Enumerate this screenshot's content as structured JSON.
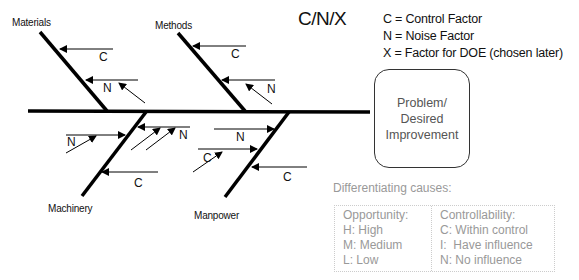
{
  "title": "C/N/X",
  "legend": {
    "items": [
      "C = Control Factor",
      "N = Noise Factor",
      "X = Factor for DOE (chosen later)"
    ]
  },
  "problem": {
    "line1": "Problem/",
    "line2": "Desired",
    "line3": "Improvement"
  },
  "categories": {
    "materials": "Materials",
    "methods": "Methods",
    "machinery": "Machinery",
    "manpower": "Manpower"
  },
  "cause_markers": {
    "materials_c": "C",
    "materials_n": "N",
    "methods_c": "C",
    "methods_n": "N",
    "machinery_n_left": "N",
    "machinery_n_right": "N",
    "machinery_c": "C",
    "manpower_n": "N",
    "manpower_c_left": "C",
    "manpower_c_right": "C"
  },
  "differentiating": {
    "title": "Differentiating causes:",
    "opportunity": {
      "header": "Opportunity:",
      "items": [
        "H: High",
        "M: Medium",
        "L: Low"
      ]
    },
    "controllability": {
      "header": "Controllability:",
      "items": [
        "C: Within control",
        "I:  Have influence",
        "N: No influence"
      ]
    }
  },
  "colors": {
    "line": "#000000",
    "text": "#111111",
    "muted_text": "#999999",
    "box_border": "#333333",
    "table_border": "#cccccc"
  }
}
